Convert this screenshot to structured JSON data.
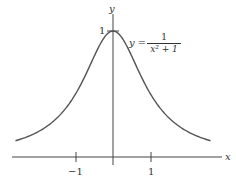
{
  "chart_data": {
    "type": "line",
    "title": "",
    "xlabel": "x",
    "ylabel": "y",
    "function": "y = 1/(x^2+1)",
    "annotation": {
      "lhs": "y =",
      "numerator": "1",
      "denominator": "x² + 1"
    },
    "x_ticks": [
      {
        "value": -1,
        "label": "−1"
      },
      {
        "value": 1,
        "label": "1"
      }
    ],
    "y_ticks": [
      {
        "value": 1,
        "label": "1"
      }
    ],
    "xlim": [
      -2.6,
      2.6
    ],
    "ylim": [
      0,
      1
    ],
    "grid": false,
    "series": [
      {
        "name": "1/(x^2+1)",
        "x": [
          -2.6,
          -2.2,
          -1.8,
          -1.4,
          -1.0,
          -0.6,
          -0.3,
          0,
          0.3,
          0.6,
          1.0,
          1.4,
          1.8,
          2.2,
          2.6
        ],
        "y": [
          0.129,
          0.171,
          0.236,
          0.338,
          0.5,
          0.735,
          0.917,
          1.0,
          0.917,
          0.735,
          0.5,
          0.338,
          0.236,
          0.171,
          0.129
        ]
      }
    ],
    "color": "#555555"
  }
}
